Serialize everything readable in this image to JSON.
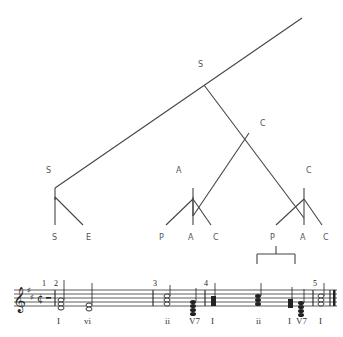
{
  "tree": {
    "root_label": "S",
    "nodes": {
      "c_mid": "C",
      "s_left": "S",
      "a_mid": "A",
      "c_right": "C"
    },
    "leaves": {
      "left": [
        "S",
        "E"
      ],
      "mid": [
        "P",
        "A",
        "C"
      ],
      "right": [
        "P",
        "A",
        "C"
      ]
    }
  },
  "score": {
    "measure_numbers": [
      "1",
      "2",
      "3",
      "4",
      "5"
    ],
    "roman_numerals": [
      "I",
      "vi",
      "ii",
      "V7",
      "I",
      "ii",
      "I",
      "V7",
      "I"
    ],
    "time_signature": "C-cut"
  }
}
